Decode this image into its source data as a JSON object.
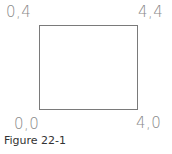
{
  "diagram": {
    "corners": {
      "top_left": "0,4",
      "top_right": "4,4",
      "bottom_left": "0,0",
      "bottom_right": "4,0"
    },
    "caption": "Figure 22-1",
    "colors": {
      "line": "#7a7a7a",
      "label": "#8a8a8a",
      "caption": "#333333"
    }
  }
}
